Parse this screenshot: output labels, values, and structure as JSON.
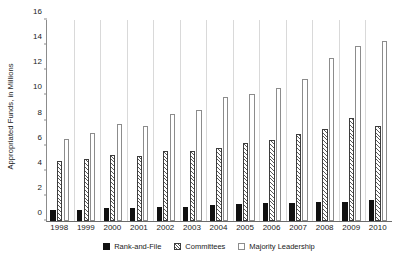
{
  "chart_data": {
    "type": "bar",
    "title": "",
    "xlabel": "",
    "ylabel": "Appropriated Funds, in Millions",
    "ylim": [
      0,
      16
    ],
    "ytick_step": 2,
    "yticks": [
      0,
      2,
      4,
      6,
      8,
      10,
      12,
      14,
      16
    ],
    "ytick_labels": [
      "0",
      "2",
      "4",
      "6",
      "8",
      "10",
      "12",
      "14",
      "16"
    ],
    "grid": false,
    "legend_position": "bottom",
    "categories": [
      "1998",
      "1999",
      "2000",
      "2001",
      "2002",
      "2003",
      "2004",
      "2005",
      "2006",
      "2007",
      "2008",
      "2009",
      "2010"
    ],
    "series": [
      {
        "name": "Rank-and-File",
        "style": "solid-black",
        "color": "#111111",
        "values": [
          0.9,
          0.9,
          1.0,
          1.0,
          1.15,
          1.15,
          1.3,
          1.35,
          1.4,
          1.45,
          1.5,
          1.55,
          1.7
        ]
      },
      {
        "name": "Committees",
        "style": "diagonal-hatch",
        "color": "#595959",
        "values": [
          4.75,
          4.95,
          5.25,
          5.15,
          5.6,
          5.6,
          5.85,
          6.2,
          6.45,
          6.9,
          7.3,
          8.2,
          7.6
        ]
      },
      {
        "name": "Majority Leadership",
        "style": "open-white",
        "color": "#8c8c8c",
        "values": [
          6.55,
          7.0,
          7.7,
          7.6,
          8.5,
          8.85,
          9.85,
          10.1,
          10.6,
          11.3,
          13.0,
          13.9,
          14.3
        ]
      }
    ]
  },
  "axis": {
    "y_title": "Appropriated Funds, in Millions"
  },
  "legend": {
    "items": [
      {
        "label": "Rank-and-File"
      },
      {
        "label": "Committees"
      },
      {
        "label": "Majority Leadership"
      }
    ]
  }
}
